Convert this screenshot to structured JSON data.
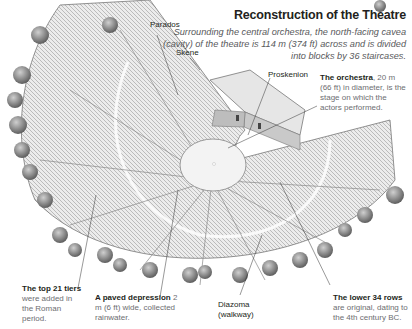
{
  "title": "Reconstruction of the Theatre",
  "subtitle": "Surrounding the central orchestra, the north-facing cavea (cavity) of the theatre is 114 m (374 ft) across and is divided into blocks by 36 staircases.",
  "labels": {
    "parados": "Parados",
    "skene": "Skene",
    "proskenion": "Proskenion",
    "diazoma_1": "Diazoma",
    "diazoma_2": "(walkway)"
  },
  "annotations": {
    "orchestra": {
      "bold": "The orchestra",
      "text": ", 20 m (66 ft) in diameter, is the stage on which the actors performed."
    },
    "top_tiers": {
      "bold": "The top 21 tiers",
      "text": " were added in the Roman period."
    },
    "paved": {
      "bold": "A paved depression",
      "text": " 2 m (6 ft) wide, collected rainwater."
    },
    "lower_rows": {
      "bold": "The lower 34 rows",
      "text": " are original, dating to the 4th century BC."
    }
  },
  "colors": {
    "heading": "#231f20",
    "body_text": "#6d6e71",
    "stone": "#d9d9d9",
    "tree": "#8a8a8a"
  }
}
